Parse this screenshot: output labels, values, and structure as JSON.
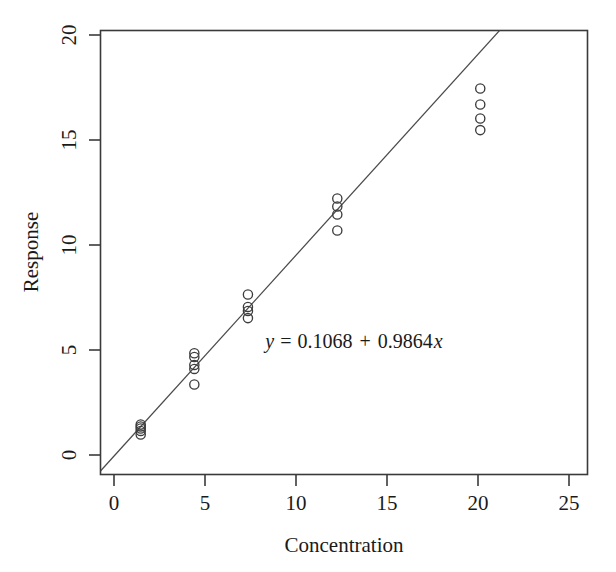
{
  "chart_data": {
    "type": "scatter",
    "title": "",
    "xlabel": "Concentration",
    "ylabel": "Response",
    "xlim": [
      -1.25,
      26.0
    ],
    "ylim": [
      -1.3,
      20.9
    ],
    "xticks": [
      0,
      5,
      10,
      15,
      20,
      25
    ],
    "xtick_labels": [
      "0",
      "5",
      "10",
      "15",
      "20",
      "25"
    ],
    "yticks": [
      0,
      5,
      10,
      15,
      20
    ],
    "ytick_labels": [
      "0",
      "5",
      "10",
      "15",
      "20"
    ],
    "grid": false,
    "legend": null,
    "marker": "open-circle",
    "series": [
      {
        "name": "observations",
        "x": [
          1,
          1,
          1,
          1,
          1,
          4,
          4,
          4,
          4,
          4,
          7,
          7,
          7,
          7,
          12,
          12,
          12,
          12,
          20,
          20,
          20,
          20
        ],
        "y": [
          0.7,
          0.88,
          1.0,
          1.1,
          1.2,
          3.2,
          3.98,
          4.18,
          4.58,
          4.76,
          6.52,
          6.88,
          7.08,
          7.7,
          10.9,
          11.7,
          12.1,
          12.5,
          15.92,
          16.5,
          17.2,
          18.0
        ]
      }
    ],
    "fit_line": {
      "type": "linear-regression",
      "intercept": 0.1068,
      "slope": 0.9864,
      "equation_label": "y = 0.1068 + 0.9864x",
      "equation_parts": {
        "y_symbol": "y",
        "equals": "=",
        "intercept_text": "0.1068",
        "plus": "+",
        "slope_text": "0.9864",
        "x_symbol": "x"
      },
      "annotation_position": {
        "x": 13.2,
        "y": 6.3
      }
    },
    "colors": {
      "axis": "#3a3a3a",
      "point_stroke": "#3d3d3d",
      "line": "#4a4a4a",
      "text": "#1a1a1a",
      "background": "#ffffff"
    }
  }
}
